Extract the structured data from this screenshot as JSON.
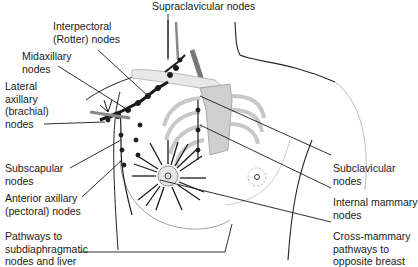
{
  "diagram": {
    "labels": {
      "supraclavicular": "Supraclavicular nodes",
      "interpectoral": "Interpectoral\n(Rotter) nodes",
      "midaxillary": "Midaxillary\nnodes",
      "lateral_axillary": "Lateral\naxillary\n(brachial)\nnodes",
      "subscapular": "Subscapular\nnodes",
      "anterior_axillary": "Anterior axillary\n(pectoral) nodes",
      "subdiaphragmatic": "Pathways to\nsubdiaphragmatic\nnodes and liver",
      "subclavicular": "Subclavicular\nnodes",
      "internal_mammary": "Internal mammary\nnodes",
      "cross_mammary": "Cross-mammary\npathways to\nopposite breast"
    },
    "colors": {
      "line": "#1a1a1a",
      "bone": "#e6e6e6",
      "sternum": "#cfcfcf",
      "vessel": "#8a8a8a"
    }
  }
}
